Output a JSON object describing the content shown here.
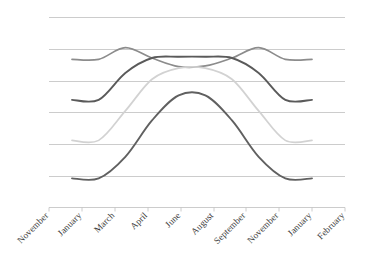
{
  "chart_data": {
    "type": "line",
    "title": "",
    "subtitle": "",
    "xlabel": "",
    "ylabel": "",
    "grid": true,
    "legend": "none",
    "gridline_count": 6,
    "ylim": [
      0,
      6
    ],
    "ytick_labels": [],
    "categories": [
      "November",
      "January",
      "March",
      "April",
      "June",
      "August",
      "September",
      "November",
      "January",
      "February"
    ],
    "x": [
      0,
      1,
      2,
      3,
      4,
      5,
      6,
      7,
      8,
      9
    ],
    "series": [
      {
        "name": "series-1-medium-gray",
        "color": "#8c8c8c",
        "values": [
          4.68,
          4.68,
          5.05,
          4.72,
          4.45,
          4.47,
          4.72,
          5.05,
          4.68,
          4.68
        ]
      },
      {
        "name": "series-2-dark-gray",
        "color": "#5a5a5a",
        "values": [
          3.4,
          3.4,
          4.25,
          4.72,
          4.76,
          4.76,
          4.72,
          4.25,
          3.4,
          3.4
        ]
      },
      {
        "name": "series-3-light-gray",
        "color": "#d2d2d2",
        "values": [
          2.12,
          2.12,
          3.05,
          4.05,
          4.4,
          4.4,
          4.05,
          3.05,
          2.12,
          2.12
        ]
      },
      {
        "name": "series-4-dark-gray-low",
        "color": "#606060",
        "values": [
          0.92,
          0.92,
          1.6,
          2.75,
          3.54,
          3.54,
          2.75,
          1.6,
          0.92,
          0.92
        ]
      }
    ]
  },
  "axis": {
    "tick_label_rotation_deg": -45,
    "axis_color": "#bfbfbf"
  }
}
